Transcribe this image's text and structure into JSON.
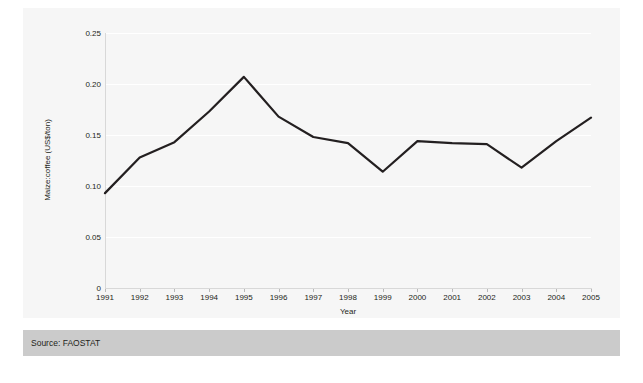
{
  "chart_data": {
    "type": "line",
    "title": "",
    "subtitle": "",
    "xlabel": "Year",
    "ylabel": "Maize:coffee (US$/ton)",
    "categories": [
      "1991",
      "1992",
      "1993",
      "1994",
      "1995",
      "1996",
      "1997",
      "1998",
      "1999",
      "2000",
      "2001",
      "2002",
      "2003",
      "2004",
      "2005"
    ],
    "x": [
      1991,
      1992,
      1993,
      1994,
      1995,
      1996,
      1997,
      1998,
      1999,
      2000,
      2001,
      2002,
      2003,
      2004,
      2005
    ],
    "values": [
      0.093,
      0.128,
      0.143,
      0.173,
      0.207,
      0.168,
      0.148,
      0.142,
      0.114,
      0.144,
      0.142,
      0.141,
      0.118,
      0.144,
      0.167
    ],
    "series": [
      {
        "name": "Maize:coffee",
        "values": [
          0.093,
          0.128,
          0.143,
          0.173,
          0.207,
          0.168,
          0.148,
          0.142,
          0.114,
          0.144,
          0.142,
          0.141,
          0.118,
          0.144,
          0.167
        ],
        "color": "#231f20"
      }
    ],
    "ylim": [
      0,
      0.25
    ],
    "xlim": [
      1991,
      2005
    ],
    "yticks": [
      0,
      0.05,
      0.1,
      0.15,
      0.2,
      0.25
    ],
    "ytick_labels": [
      "0",
      "0.05",
      "0.10",
      "0.15",
      "0.20",
      "0.25"
    ],
    "xtick_labels": [
      "1991",
      "1992",
      "1993",
      "1994",
      "1995",
      "1996",
      "1997",
      "1998",
      "1999",
      "2000",
      "2001",
      "2002",
      "2003",
      "2004",
      "2005"
    ],
    "grid": "horizontal",
    "grid_color": "#ffffff",
    "legend": "none",
    "plot_background": "#f6f6f6",
    "figure_background": "#ffffff",
    "line_color": "#231f20",
    "line_width": 2.2,
    "markers": "none",
    "annotations": []
  },
  "footer": {
    "source_label": "Source: FAOSTAT",
    "band_color": "#cbcbcb"
  }
}
